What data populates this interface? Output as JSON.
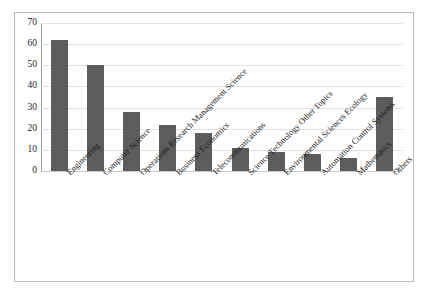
{
  "chart_data": {
    "type": "bar",
    "title": "",
    "subtitle": "",
    "xlabel": "",
    "ylabel": "",
    "categories": [
      "Engineering",
      "Computer Science",
      "Operations Research Management Science",
      "Business Economics",
      "Telecommunications",
      "Science Technology Other Topics",
      "Environmental Sciences Ecology",
      "Automation Control Systems",
      "Mathematics",
      "Others"
    ],
    "values": [
      62,
      50,
      28,
      22,
      18,
      11,
      9,
      8,
      6,
      35
    ],
    "ylim": [
      0,
      70
    ],
    "yticks": [
      0,
      10,
      20,
      30,
      40,
      50,
      60,
      70
    ],
    "ytick_labels": [
      "0",
      "10",
      "20",
      "30",
      "40",
      "50",
      "60",
      "70"
    ],
    "grid": true,
    "grid_axis": "y",
    "legend": false,
    "legend_position": "none",
    "bar_color": "#5c5c5c",
    "gridline_color": "#e2e2e2",
    "axis_color": "#9a9a9a",
    "border_color": "#b9b9b9",
    "background_color": "#ffffff",
    "label_rotation_degrees": 45
  }
}
